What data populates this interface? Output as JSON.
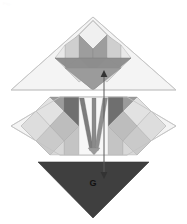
{
  "figure": {
    "caption_faint": "Fig.",
    "background_color": "#ffffff",
    "width": 187,
    "height": 224,
    "type": "quilt-block-geometric-diagram"
  },
  "labels": {
    "bottom_triangle_label": "G"
  },
  "annotations": {
    "measure_arrow": {
      "name": "vertical-double-headed-arrow",
      "x": 104,
      "y_top": 72,
      "y_bottom": 176,
      "color": "#5a5a5a"
    }
  },
  "palette": {
    "white": "#ffffff",
    "near_white": "#fafafa",
    "pale": "#f2f2f2",
    "light_gray": "#e6e6e6",
    "mid_light_gray": "#d2d2d2",
    "mid_gray": "#b8b8b8",
    "gray": "#a0a0a0",
    "dark_gray": "#8a8a8a",
    "darker_gray": "#6f6f6f",
    "charcoal": "#3f3f3f",
    "outline": "#9a9a9a",
    "outline_light": "#c9c9c9"
  },
  "regions": [
    {
      "name": "top-triangle-panel",
      "shape": "triangle",
      "fill": "#f2f2f2",
      "points": "93,17 176,90 11,90"
    },
    {
      "name": "middle-band-panel",
      "shape": "hexagon-band",
      "fill": "#f2f2f2",
      "points": "11,97 60,97 60,97 176,97 176,155 11,155"
    },
    {
      "name": "bottom-triangle-panel",
      "shape": "triangle",
      "fill": "#3f3f3f",
      "points": "38,162 149,162 93,218"
    }
  ],
  "motifs": {
    "top_star": {
      "name": "tulip-star-motif",
      "center_x": 93,
      "center_y": 72,
      "petal_count": 6,
      "base_fill": "#8a8a8a"
    },
    "left_star": {
      "name": "eight-point-star-left",
      "center_x": 50,
      "center_y": 126
    },
    "right_star": {
      "name": "eight-point-star-right",
      "center_x": 137,
      "center_y": 126
    },
    "center_panel": {
      "name": "center-v-stripes-panel",
      "stripe_count": 3,
      "stripe_fill": "#7d7d7d"
    }
  }
}
